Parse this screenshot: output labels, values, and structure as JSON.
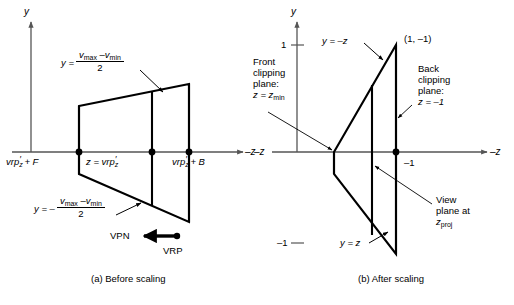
{
  "figure": {
    "background_color": "#ffffff",
    "line_color": "#000000",
    "axis_color": "#808080"
  },
  "panel_a": {
    "caption": "(a) Before scaling",
    "axis_y_label": "y",
    "axis_z_label": "–z",
    "equation_top": {
      "lhs": "y =",
      "numerator_a": "v",
      "numerator_a_sub": "max",
      "numerator_op": "–",
      "numerator_b": "v",
      "numerator_b_sub": "min",
      "denominator": "2"
    },
    "equation_bottom": {
      "lhs": "y = –",
      "numerator_a": "v",
      "numerator_a_sub": "max",
      "numerator_op": "–",
      "numerator_b": "v",
      "numerator_b_sub": "min",
      "denominator": "2"
    },
    "label_front": "vrp",
    "label_front_sub": "z",
    "label_front_rest": "+ F",
    "label_center": "z = vrp",
    "label_center_sub": "z",
    "label_back": "vrp",
    "label_back_sub": "z",
    "label_back_rest": "+ B",
    "label_vpn": "VPN",
    "label_vrp": "VRP"
  },
  "panel_b": {
    "caption": "(b) After scaling",
    "axis_y_label": "y",
    "axis_z_label": "–z",
    "axis_z_label_left": "–z",
    "tick_y_pos": "1",
    "tick_y_neg": "–1",
    "tick_z_neg": "–1",
    "label_y_eq_neg_z": "y = –z",
    "label_y_eq_z": "y = z",
    "label_corner_point": "(1, –1)",
    "label_front_clip_line1": "Front",
    "label_front_clip_line2": "clipping",
    "label_front_clip_line3": "plane:",
    "label_front_clip_eq": "z = z",
    "label_front_clip_eq_sub": "min",
    "label_back_clip_line1": "Back",
    "label_back_clip_line2": "clipping",
    "label_back_clip_line3": "plane:",
    "label_back_clip_eq": "z = –1",
    "label_view_plane_line1": "View",
    "label_view_plane_line2": "plane at",
    "label_view_plane_eq": "z",
    "label_view_plane_eq_sub": "proj"
  }
}
